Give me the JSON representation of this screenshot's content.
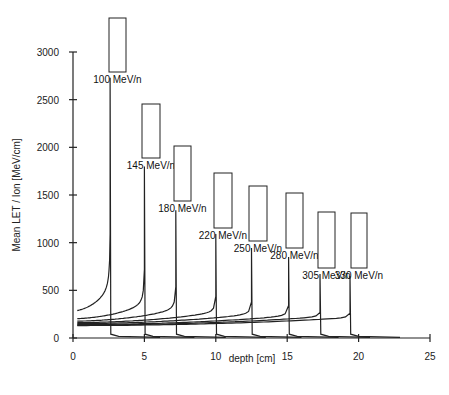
{
  "chart_data": {
    "type": "line",
    "title": "",
    "xlabel": "depth [cm]",
    "ylabel": "Mean LET / Ion  [MeV/cm]",
    "xlim": [
      0,
      25
    ],
    "ylim": [
      0,
      3000
    ],
    "xticks": [
      0,
      5,
      10,
      15,
      20,
      25
    ],
    "yticks": [
      0,
      500,
      1000,
      1500,
      2000,
      2500,
      3000
    ],
    "grid": false,
    "legend": "inline labels at each Bragg peak",
    "series": [
      {
        "name": "100 MeV/n",
        "entrance_let": 280,
        "peak_depth": 2.6,
        "peak_let": 2730,
        "label_box": {
          "x": [
            109,
            126
          ],
          "y": [
            18,
            72
          ]
        }
      },
      {
        "name": "145 MeV/n",
        "entrance_let": 200,
        "peak_depth": 5.0,
        "peak_let": 1800,
        "label_box": {
          "x": [
            142,
            160
          ],
          "y": [
            104,
            158
          ]
        }
      },
      {
        "name": "180 MeV/n",
        "entrance_let": 175,
        "peak_depth": 7.2,
        "peak_let": 1340,
        "label_box": {
          "x": [
            174,
            191
          ],
          "y": [
            146,
            201
          ]
        }
      },
      {
        "name": "220 MeV/n",
        "entrance_let": 160,
        "peak_depth": 10.0,
        "peak_let": 1090,
        "label_box": {
          "x": [
            214,
            232
          ],
          "y": [
            173,
            228
          ]
        }
      },
      {
        "name": "250 MeV/n",
        "entrance_let": 150,
        "peak_depth": 12.5,
        "peak_let": 945,
        "label_box": {
          "x": [
            249,
            267
          ],
          "y": [
            186,
            241
          ]
        }
      },
      {
        "name": "280 MeV/n",
        "entrance_let": 140,
        "peak_depth": 15.1,
        "peak_let": 850,
        "label_box": {
          "x": [
            286,
            303
          ],
          "y": [
            193,
            248
          ]
        }
      },
      {
        "name": "305 MeV/n",
        "entrance_let": 135,
        "peak_depth": 17.3,
        "peak_let": 670,
        "label_box": {
          "x": [
            318,
            335
          ],
          "y": [
            212,
            268
          ]
        }
      },
      {
        "name": "330 MeV/n",
        "entrance_let": 130,
        "peak_depth": 19.4,
        "peak_let": 650,
        "label_box": {
          "x": [
            351,
            367
          ],
          "y": [
            213,
            268
          ]
        }
      }
    ]
  },
  "layout": {
    "plot": {
      "x0": 73,
      "x25": 430,
      "y0": 338,
      "y3000": 52
    }
  }
}
